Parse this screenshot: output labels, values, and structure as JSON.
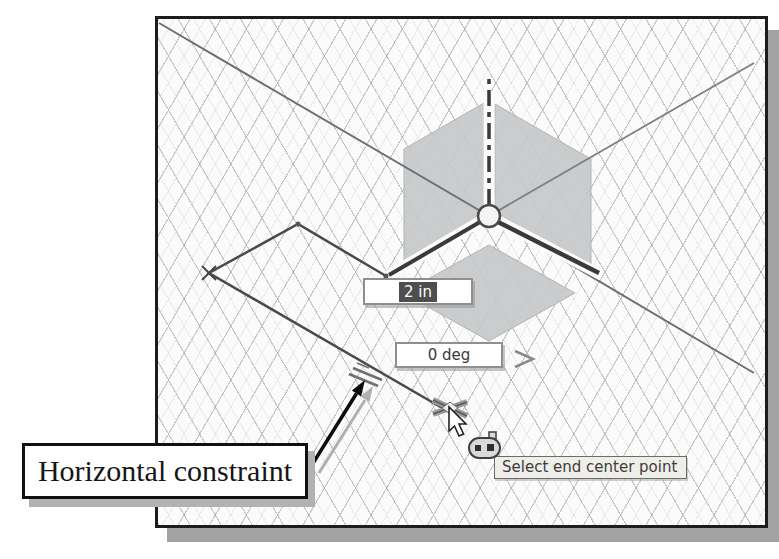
{
  "callout": {
    "label": "Horizontal constraint"
  },
  "viewport": {
    "dynamic_inputs": {
      "length": {
        "value": "2 in",
        "selected": true
      },
      "angle": {
        "value": "0 deg",
        "selected": false
      }
    },
    "status_tooltip": "Select end center point",
    "icons": {
      "horizontal_constraint": "two-parallel-lines",
      "coincident_constraint": "pill-with-two-points",
      "endpoint_marker": "x-cross-marker",
      "cursor": "arrow-pointer",
      "origin": "origin-triad-with-planes",
      "angle_leader": "chevron-right"
    },
    "colors": {
      "viewport_bg": "#fbfbfa",
      "grid_line": "#9199a3",
      "plane_fill": "#c6c8ca",
      "axis_dark": "#3a3a3a",
      "sketch_line": "#4a4a4a",
      "highlight_bg": "#4e4e4e",
      "highlight_text": "#ffffff",
      "frame_border": "#1c1c1c",
      "frame_shadow": "#a2a2a2",
      "tooltip_bg": "#f0eee9"
    }
  }
}
